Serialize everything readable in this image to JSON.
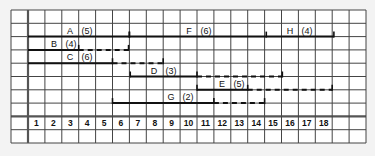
{
  "diagram": {
    "type": "gantt-chart-with-float",
    "timeline": {
      "columns": [
        "1",
        "2",
        "3",
        "4",
        "5",
        "6",
        "7",
        "8",
        "9",
        "10",
        "11",
        "12",
        "13",
        "14",
        "15",
        "16",
        "17",
        "18",
        "",
        ""
      ]
    },
    "activities": [
      {
        "name": "A",
        "duration": "(5)",
        "row": 2,
        "start_col": 0,
        "solid_end_col": 6,
        "float_end_col": 6,
        "start_tick": false,
        "label_x": 70
      },
      {
        "name": "F",
        "duration": "(6)",
        "row": 2,
        "start_col": 6,
        "solid_end_col": 14.1,
        "float_end_col": 14.1,
        "start_tick": true,
        "label_x": 189
      },
      {
        "name": "H",
        "duration": "(4)",
        "row": 2,
        "start_col": 14.1,
        "solid_end_col": 18.1,
        "float_end_col": 18.1,
        "start_tick": false,
        "label_x": 290
      },
      {
        "name": "B",
        "duration": "(4)",
        "row": 3,
        "start_col": 0,
        "solid_end_col": 3,
        "float_end_col": 5.95,
        "start_tick": false,
        "label_x": 54
      },
      {
        "name": "C",
        "duration": "(6)",
        "row": 4,
        "start_col": 0,
        "solid_end_col": 5,
        "float_end_col": 8,
        "start_tick": false,
        "label_x": 70
      },
      {
        "name": "D",
        "duration": "(3)",
        "row": 5,
        "start_col": 6.05,
        "solid_end_col": 10,
        "float_end_col": 15.05,
        "start_tick": true,
        "label_x": 154
      },
      {
        "name": "E",
        "duration": "(5)",
        "row": 6,
        "start_col": 10,
        "solid_end_col": 13,
        "float_end_col": 18,
        "start_tick": true,
        "label_x": 222
      },
      {
        "name": "G",
        "duration": "(2)",
        "row": 7,
        "start_col": 5,
        "solid_end_col": 11,
        "float_end_col": 14,
        "start_tick": true,
        "label_x": 171
      }
    ]
  }
}
